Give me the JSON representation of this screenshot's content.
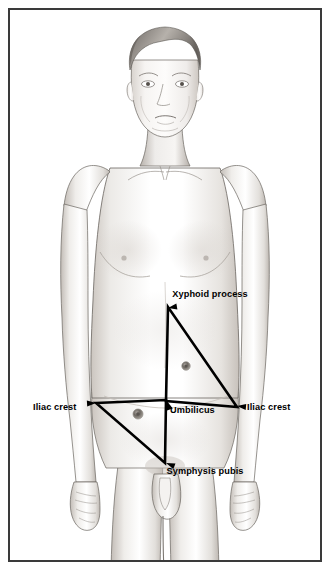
{
  "illustration": {
    "title": "Anatomical landmarks of the abdomen",
    "subject": "standing adult male figure, anterior view",
    "style": "pencil / graphite medical illustration",
    "frame": {
      "border_color": "#3a3a3a",
      "border_width_px": 2,
      "background": "#ffffff",
      "inset_px": 8
    },
    "palette": {
      "outline": "#4a4a4a",
      "skin_shade_light": "#f2f0ee",
      "skin_shade_mid": "#dedad6",
      "skin_shade_dark": "#b9b3ad",
      "hair": "#6e6a66",
      "marker_ring": "#8a8580",
      "marker_core": "#5a5550",
      "label_text": "#000000",
      "triangle_line": "#000000"
    }
  },
  "labels": [
    {
      "id": "xyphoid-process",
      "text": "Xyphoid process",
      "x": 210,
      "y": 297,
      "anchor": "middle",
      "points_to": {
        "x": 168,
        "y": 308
      }
    },
    {
      "id": "iliac-crest-left",
      "text": "Iliac crest",
      "x": 33,
      "y": 410,
      "anchor": "start",
      "points_to": {
        "x": 96,
        "y": 403
      }
    },
    {
      "id": "umbilicus",
      "text": "Umbilicus",
      "x": 170,
      "y": 413,
      "anchor": "start",
      "points_to": {
        "x": 167,
        "y": 401
      }
    },
    {
      "id": "iliac-crest-right",
      "text": "Iliac crest",
      "x": 247,
      "y": 410,
      "anchor": "start",
      "points_to": {
        "x": 237,
        "y": 406
      }
    },
    {
      "id": "symphysis-pubis",
      "text": "Symphysis pubis",
      "x": 205,
      "y": 474,
      "anchor": "middle",
      "points_to": {
        "x": 166,
        "y": 463
      }
    }
  ],
  "triangles": [
    {
      "id": "upper-triangle",
      "name": "xyphoid-umbilicus-iliac triangle",
      "vertices": [
        {
          "label": "Xyphoid process",
          "x": 168,
          "y": 307
        },
        {
          "label": "Umbilicus",
          "x": 166,
          "y": 401
        },
        {
          "label": "Iliac crest",
          "x": 237,
          "y": 407
        }
      ],
      "stroke": "#000000",
      "stroke_width": 2.6
    },
    {
      "id": "lower-triangle",
      "name": "iliac-umbilicus-symphysis triangle",
      "vertices": [
        {
          "label": "Iliac crest",
          "x": 96,
          "y": 403
        },
        {
          "label": "Umbilicus",
          "x": 166,
          "y": 400
        },
        {
          "label": "Symphysis pubis",
          "x": 165,
          "y": 463
        }
      ],
      "stroke": "#000000",
      "stroke_width": 2.6
    }
  ],
  "markers": [
    {
      "id": "marker-upper",
      "x": 186,
      "y": 366,
      "r": 4.2
    },
    {
      "id": "marker-lower",
      "x": 138,
      "y": 414,
      "r": 5.0
    }
  ]
}
